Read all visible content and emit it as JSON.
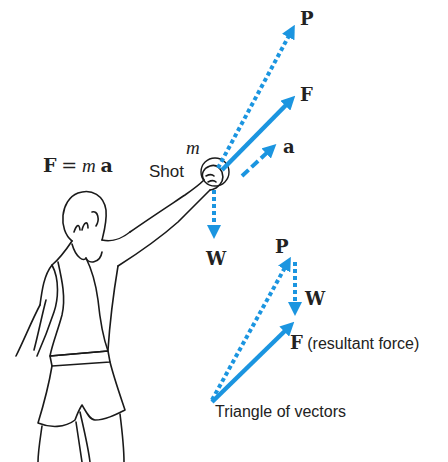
{
  "colors": {
    "vector": "#1b95e0",
    "ink": "#222222",
    "background": "#ffffff"
  },
  "equation": {
    "lhs": "F",
    "equals": "=",
    "mass": "m",
    "acc": "a"
  },
  "shot": {
    "mass_label": "m",
    "label": "Shot"
  },
  "vectors": {
    "P": "P",
    "F": "F",
    "a": "a",
    "W": "W"
  },
  "triangle": {
    "P": "P",
    "W": "W",
    "F": "F",
    "F_note": "(resultant force)",
    "caption": "Triangle of vectors"
  }
}
